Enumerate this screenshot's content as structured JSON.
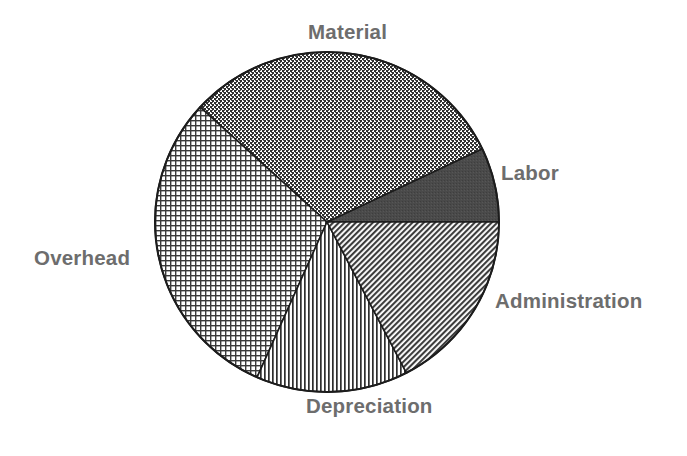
{
  "figure": {
    "background_color": "#ffffff",
    "label_color": "#6d6d6d",
    "outline_color": "#1c1c1c"
  },
  "chart_data": {
    "type": "pie",
    "title": "",
    "subtitle": "",
    "xlabel": "",
    "ylabel": "",
    "legend_position": "none",
    "grid": false,
    "labels_placement": "outside-around-pie",
    "center": {
      "x": 327,
      "y": 222
    },
    "radius": {
      "rx": 172,
      "ry": 170
    },
    "start_angle_deg": 0,
    "direction": "counterclockwise",
    "categories": [
      "Labor",
      "Material",
      "Overhead",
      "Depreciation",
      "Administration"
    ],
    "values": [
      7.1,
      31.1,
      30.1,
      14.3,
      17.4
    ],
    "slices": [
      {
        "label": "Labor",
        "value": 7.1,
        "angle_start_deg": 0,
        "angle_end_deg": 25.5,
        "sweep_deg": 25.5,
        "fill_pattern": "solid-dark-gray",
        "fill_color": "#4a4a4a"
      },
      {
        "label": "Material",
        "value": 31.1,
        "angle_start_deg": 25.5,
        "angle_end_deg": 137.5,
        "sweep_deg": 112.0,
        "fill_pattern": "dense-stipple-dots",
        "fill_color": "#3a3a3a"
      },
      {
        "label": "Overhead",
        "value": 30.1,
        "angle_start_deg": 137.5,
        "angle_end_deg": 246.0,
        "sweep_deg": 108.5,
        "fill_pattern": "fine-crosshatch-grid",
        "fill_color": "#545454"
      },
      {
        "label": "Depreciation",
        "value": 14.3,
        "angle_start_deg": 246.0,
        "angle_end_deg": 297.5,
        "sweep_deg": 51.5,
        "fill_pattern": "vertical-stripes",
        "fill_color": "#4f4f4f"
      },
      {
        "label": "Administration",
        "value": 17.4,
        "angle_start_deg": 297.5,
        "angle_end_deg": 360.0,
        "sweep_deg": 62.5,
        "fill_pattern": "diagonal-hatch",
        "fill_color": "#585858"
      }
    ]
  },
  "labels": {
    "material": "Material",
    "labor": "Labor",
    "administration": "Administration",
    "depreciation": "Depreciation",
    "overhead": "Overhead"
  }
}
